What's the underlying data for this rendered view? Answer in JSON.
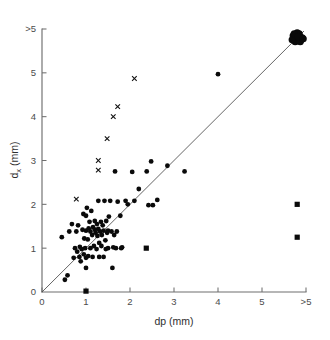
{
  "figure": {
    "background_color": "#ffffff",
    "marker_color": "#0a0a0a",
    "axis_color": "#6e6e6e",
    "line_color": "#4a4a4a"
  },
  "axes": {
    "x_title": "dp (mm)",
    "y_title_main": "d",
    "y_title_sub": "x",
    "y_title_unit": " (mm)",
    "x_ticks": [
      "0",
      "1",
      "2",
      "3",
      "4",
      "5",
      ">5"
    ],
    "y_ticks": [
      "0",
      "1",
      "2",
      "3",
      "4",
      "5",
      ">5"
    ]
  },
  "chart_data": {
    "type": "scatter",
    "title": "",
    "xlabel": "dp (mm)",
    "ylabel": "dx (mm)",
    "xlim": [
      0,
      6
    ],
    "ylim": [
      0,
      6
    ],
    "grid": false,
    "legend": "none",
    "annotations": [
      {
        "text": "identity line y = x",
        "from": [
          0,
          0
        ],
        "to": [
          6,
          6
        ]
      }
    ],
    "series": [
      {
        "name": "circles",
        "marker": "circle",
        "points": [
          [
            0.45,
            1.25
          ],
          [
            0.52,
            0.28
          ],
          [
            0.58,
            0.38
          ],
          [
            0.62,
            1.38
          ],
          [
            0.68,
            1.55
          ],
          [
            0.72,
            0.78
          ],
          [
            0.75,
            1.0
          ],
          [
            0.78,
            1.38
          ],
          [
            0.8,
            0.92
          ],
          [
            0.82,
            1.52
          ],
          [
            0.85,
            0.8
          ],
          [
            0.86,
            1.03
          ],
          [
            0.88,
            0.7
          ],
          [
            0.9,
            0.98
          ],
          [
            0.92,
            1.42
          ],
          [
            0.94,
            1.78
          ],
          [
            0.95,
            0.86
          ],
          [
            0.96,
            1.22
          ],
          [
            0.98,
            1.0
          ],
          [
            1.0,
            0.55
          ],
          [
            1.0,
            0.78
          ],
          [
            1.0,
            1.4
          ],
          [
            1.0,
            1.74
          ],
          [
            1.02,
            1.92
          ],
          [
            1.04,
            1.2
          ],
          [
            1.05,
            0.82
          ],
          [
            1.06,
            1.45
          ],
          [
            1.08,
            1.6
          ],
          [
            1.1,
            1.0
          ],
          [
            1.1,
            1.38
          ],
          [
            1.12,
            1.85
          ],
          [
            1.14,
            1.3
          ],
          [
            1.15,
            0.8
          ],
          [
            1.16,
            1.48
          ],
          [
            1.18,
            1.05
          ],
          [
            1.2,
            1.42
          ],
          [
            1.2,
            1.62
          ],
          [
            1.22,
            1.35
          ],
          [
            1.24,
            0.98
          ],
          [
            1.25,
            1.55
          ],
          [
            1.26,
            1.28
          ],
          [
            1.28,
            2.08
          ],
          [
            1.28,
            1.44
          ],
          [
            1.3,
            0.8
          ],
          [
            1.3,
            1.12
          ],
          [
            1.32,
            1.38
          ],
          [
            1.34,
            1.6
          ],
          [
            1.35,
            1.05
          ],
          [
            1.36,
            1.3
          ],
          [
            1.38,
            1.52
          ],
          [
            1.4,
            0.8
          ],
          [
            1.4,
            1.4
          ],
          [
            1.42,
            2.08
          ],
          [
            1.44,
            1.18
          ],
          [
            1.45,
            0.98
          ],
          [
            1.46,
            1.62
          ],
          [
            1.48,
            1.35
          ],
          [
            1.5,
            1.0
          ],
          [
            1.5,
            1.4
          ],
          [
            1.52,
            1.72
          ],
          [
            1.55,
            2.08
          ],
          [
            1.58,
            1.38
          ],
          [
            1.6,
            0.55
          ],
          [
            1.62,
            1.02
          ],
          [
            1.64,
            1.3
          ],
          [
            1.66,
            2.75
          ],
          [
            1.68,
            1.0
          ],
          [
            1.7,
            1.38
          ],
          [
            1.72,
            2.06
          ],
          [
            1.78,
            1.74
          ],
          [
            1.8,
            1.0
          ],
          [
            1.82,
            1.02
          ],
          [
            1.9,
            2.08
          ],
          [
            1.95,
            2.0
          ],
          [
            2.05,
            2.74
          ],
          [
            2.1,
            2.08
          ],
          [
            2.2,
            2.35
          ],
          [
            2.38,
            2.75
          ],
          [
            2.42,
            1.98
          ],
          [
            2.48,
            2.98
          ],
          [
            2.52,
            1.98
          ],
          [
            2.62,
            2.1
          ],
          [
            2.85,
            2.88
          ],
          [
            3.24,
            2.75
          ],
          [
            4.0,
            4.97
          ]
        ]
      },
      {
        "name": "squares",
        "marker": "square",
        "points": [
          [
            1.0,
            0.02
          ],
          [
            2.37,
            1.0
          ],
          [
            5.8,
            2.0
          ],
          [
            5.8,
            1.25
          ]
        ]
      },
      {
        "name": "crosses",
        "marker": "x",
        "points": [
          [
            0.78,
            2.12
          ],
          [
            1.28,
            2.78
          ],
          [
            1.28,
            3.0
          ],
          [
            1.48,
            3.5
          ],
          [
            1.62,
            4.0
          ],
          [
            1.72,
            4.23
          ],
          [
            2.1,
            4.87
          ]
        ]
      },
      {
        "name": "censored-cluster",
        "marker": "blob",
        "points": [
          [
            5.8,
            5.8
          ]
        ],
        "description": "dense overlapping cluster of points at (>5, >5)"
      }
    ]
  }
}
